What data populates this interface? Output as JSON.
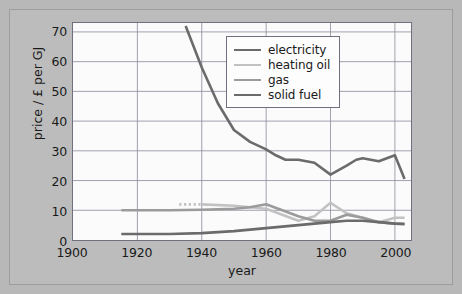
{
  "chart_data": {
    "type": "line",
    "title": "",
    "xlabel": "year",
    "ylabel": "price / £ per GJ",
    "xlim": [
      1900,
      2005
    ],
    "ylim": [
      0,
      73
    ],
    "xticks": [
      1900,
      1920,
      1940,
      1960,
      1980,
      2000
    ],
    "xtick_labels": [
      "1900",
      "1920",
      "1940",
      "1960",
      "1980",
      "2000"
    ],
    "yticks": [
      0,
      10,
      20,
      30,
      40,
      50,
      60,
      70
    ],
    "ytick_labels": [
      "0",
      "10",
      "20",
      "30",
      "40",
      "50",
      "60",
      "70"
    ],
    "grid": true,
    "legend_position": "upper right",
    "series": [
      {
        "name": "electricity",
        "color": "#6b6b6b",
        "width": 2.6,
        "dashed": false,
        "x": [
          1935,
          1940,
          1945,
          1950,
          1955,
          1960,
          1963,
          1966,
          1970,
          1975,
          1980,
          1985,
          1988,
          1990,
          1995,
          2000,
          2003
        ],
        "y": [
          72,
          58,
          46,
          37,
          33,
          30.5,
          28.5,
          27,
          27,
          26,
          22,
          25,
          27,
          27.5,
          26.5,
          28.5,
          20.5
        ]
      },
      {
        "name": "heating oil",
        "color": "#c2c2c2",
        "width": 2.6,
        "dashed": true,
        "x": [
          1933,
          1940
        ],
        "y": [
          12,
          12
        ]
      },
      {
        "name": "heating oil",
        "color": "#c2c2c2",
        "width": 2.6,
        "dashed": false,
        "x": [
          1940,
          1950,
          1955,
          1960,
          1965,
          1970,
          1975,
          1980,
          1985,
          1990,
          1995,
          2000,
          2003
        ],
        "y": [
          12,
          11.5,
          11,
          10.5,
          8.5,
          6.5,
          8,
          12.5,
          9,
          7.5,
          6,
          7.5,
          7.5
        ]
      },
      {
        "name": "gas",
        "color": "#9b9b9b",
        "width": 2.6,
        "dashed": false,
        "x": [
          1915,
          1930,
          1940,
          1950,
          1955,
          1960,
          1965,
          1970,
          1975,
          1980,
          1985,
          1990,
          1995,
          2000,
          2003
        ],
        "y": [
          10,
          10,
          10.2,
          10.5,
          11,
          12,
          10,
          8,
          6.5,
          6.5,
          8.5,
          7.5,
          6,
          5.5,
          5.5
        ]
      },
      {
        "name": "solid fuel",
        "color": "#6b6b6b",
        "width": 2.6,
        "dashed": false,
        "x": [
          1915,
          1930,
          1940,
          1950,
          1960,
          1965,
          1970,
          1975,
          1980,
          1985,
          1990,
          1995,
          2000,
          2003
        ],
        "y": [
          2,
          2,
          2.3,
          3,
          4,
          4.5,
          5,
          5.5,
          6,
          6.5,
          6.5,
          6,
          5.5,
          5.3
        ]
      }
    ],
    "legend_entries": [
      {
        "label": "electricity",
        "color": "#6b6b6b"
      },
      {
        "label": "heating oil",
        "color": "#c2c2c2"
      },
      {
        "label": "gas",
        "color": "#9b9b9b"
      },
      {
        "label": "solid fuel",
        "color": "#6b6b6b"
      }
    ]
  }
}
